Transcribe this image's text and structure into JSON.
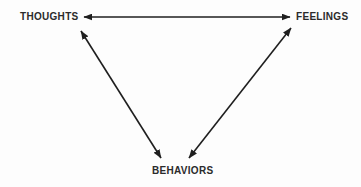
{
  "diagram": {
    "type": "triangle-relationship-diagram",
    "nodes": {
      "thoughts": {
        "label": "THOUGHTS"
      },
      "feelings": {
        "label": "FEELINGS"
      },
      "behaviors": {
        "label": "BEHAVIORS"
      }
    },
    "edges": [
      {
        "from": "thoughts",
        "to": "feelings",
        "direction": "bidirectional"
      },
      {
        "from": "thoughts",
        "to": "behaviors",
        "direction": "bidirectional"
      },
      {
        "from": "feelings",
        "to": "behaviors",
        "direction": "bidirectional"
      }
    ],
    "colors": {
      "line": "#1f1f1f",
      "text": "#2b2b2b",
      "background": "#fdfdfd"
    }
  }
}
